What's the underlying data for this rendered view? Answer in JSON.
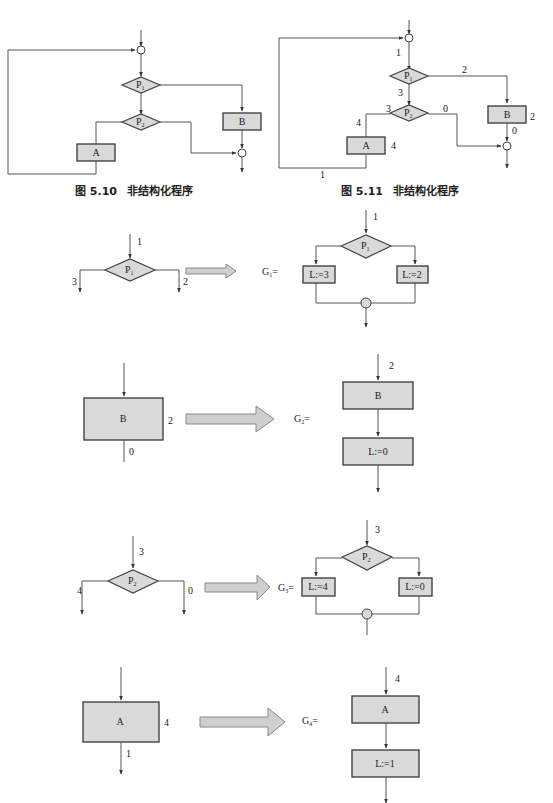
{
  "fig510": {
    "caption_num": "图 5.10",
    "caption_text": "非结构化程序",
    "p1": "P",
    "p1_sub": "1",
    "p2": "P",
    "p2_sub": "2",
    "a": "A",
    "b": "B"
  },
  "fig511": {
    "caption_num": "图 5.11",
    "caption_text": "非结构化程序",
    "p1": "P",
    "p1_sub": "1",
    "p2": "P",
    "p2_sub": "2",
    "a": "A",
    "b": "B",
    "labels": {
      "entry": "1",
      "p1_right": "2",
      "p1_down": "3",
      "p2_left_in": "3",
      "p2_right": "0",
      "a_top": "4",
      "a_right": "4",
      "b_right": "2",
      "b_down": "0",
      "loop_bottom": "1"
    }
  },
  "g1": {
    "left": {
      "p": "P",
      "p_sub": "1",
      "in": "1",
      "out_left": "3",
      "out_right": "2"
    },
    "name": "G",
    "name_sub": "1",
    "eq": "=",
    "right": {
      "p": "P",
      "p_sub": "1",
      "in": "1",
      "box_left": "L:=3",
      "box_right": "L:=2"
    }
  },
  "g2": {
    "left": {
      "box": "B",
      "side": "2",
      "out": "0"
    },
    "name": "G",
    "name_sub": "2",
    "eq": "=",
    "right": {
      "in": "2",
      "box_top": "B",
      "box_bottom": "L:=0"
    }
  },
  "g3": {
    "left": {
      "p": "P",
      "p_sub": "2",
      "in": "3",
      "out_left": "4",
      "out_right": "0"
    },
    "name": "G",
    "name_sub": "3",
    "eq": "=",
    "right": {
      "p": "P",
      "p_sub": "2",
      "in": "3",
      "box_left": "L:=4",
      "box_right": "L:=0"
    }
  },
  "g4": {
    "left": {
      "box": "A",
      "side": "4",
      "out": "1"
    },
    "name": "G",
    "name_sub": "4",
    "eq": "=",
    "right": {
      "in": "4",
      "box_top": "A",
      "box_bottom": "L:=1"
    }
  }
}
